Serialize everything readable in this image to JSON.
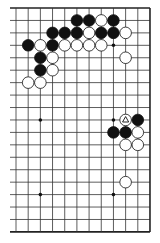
{
  "diagram": {
    "type": "go-board-partial",
    "board_size": 19,
    "visible_columns": 12,
    "visible_rows": 19,
    "grid": {
      "x0": 16,
      "dx": 12.18,
      "y0": 8,
      "dy": 12.44,
      "left_extent": 10
    },
    "edges": [
      "top",
      "right",
      "bottom"
    ],
    "colors": {
      "line": "#333333",
      "black": "#111111",
      "white": "#ffffff",
      "edge": "#222222"
    },
    "star_points": [
      {
        "c": 2,
        "r": 9
      },
      {
        "c": 8,
        "r": 3
      },
      {
        "c": 8,
        "r": 9
      },
      {
        "c": 2,
        "r": 15
      },
      {
        "c": 8,
        "r": 15
      }
    ],
    "stones": [
      {
        "c": 5,
        "r": 1,
        "color": "black"
      },
      {
        "c": 6,
        "r": 1,
        "color": "black"
      },
      {
        "c": 7,
        "r": 1,
        "color": "white"
      },
      {
        "c": 8,
        "r": 1,
        "color": "black"
      },
      {
        "c": 3,
        "r": 2,
        "color": "black"
      },
      {
        "c": 4,
        "r": 2,
        "color": "black"
      },
      {
        "c": 5,
        "r": 2,
        "color": "black"
      },
      {
        "c": 6,
        "r": 2,
        "color": "white"
      },
      {
        "c": 7,
        "r": 2,
        "color": "black"
      },
      {
        "c": 8,
        "r": 2,
        "color": "black"
      },
      {
        "c": 9,
        "r": 2,
        "color": "white"
      },
      {
        "c": 1,
        "r": 3,
        "color": "black"
      },
      {
        "c": 2,
        "r": 3,
        "color": "white"
      },
      {
        "c": 3,
        "r": 3,
        "color": "black"
      },
      {
        "c": 4,
        "r": 3,
        "color": "white"
      },
      {
        "c": 5,
        "r": 3,
        "color": "white"
      },
      {
        "c": 6,
        "r": 3,
        "color": "white"
      },
      {
        "c": 7,
        "r": 3,
        "color": "white"
      },
      {
        "c": 2,
        "r": 4,
        "color": "black"
      },
      {
        "c": 3,
        "r": 4,
        "color": "white"
      },
      {
        "c": 9,
        "r": 4,
        "color": "white"
      },
      {
        "c": 2,
        "r": 5,
        "color": "black"
      },
      {
        "c": 3,
        "r": 5,
        "color": "white"
      },
      {
        "c": 1,
        "r": 6,
        "color": "white"
      },
      {
        "c": 2,
        "r": 6,
        "color": "white"
      },
      {
        "c": 9,
        "r": 9,
        "color": "white",
        "marker": "triangle"
      },
      {
        "c": 10,
        "r": 9,
        "color": "black"
      },
      {
        "c": 8,
        "r": 10,
        "color": "black"
      },
      {
        "c": 9,
        "r": 10,
        "color": "black"
      },
      {
        "c": 10,
        "r": 10,
        "color": "white"
      },
      {
        "c": 9,
        "r": 11,
        "color": "white"
      },
      {
        "c": 10,
        "r": 11,
        "color": "white"
      },
      {
        "c": 9,
        "r": 14,
        "color": "white"
      }
    ]
  }
}
